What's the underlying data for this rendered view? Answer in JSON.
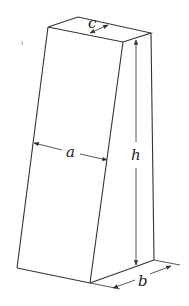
{
  "figure": {
    "type": "prism-diagram",
    "labels": {
      "a": "a",
      "b": "b",
      "c": "c",
      "h": "h"
    },
    "colors": {
      "line": "#333333",
      "background": "#ffffff"
    }
  }
}
